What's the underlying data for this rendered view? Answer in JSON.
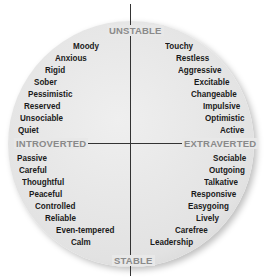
{
  "axes": {
    "top": "UNSTABLE",
    "bottom": "STABLE",
    "left": "INTROVERTED",
    "right": "EXTRAVERTED"
  },
  "quadrants": {
    "unstable_introverted": [
      "Moody",
      "Anxious",
      "Rigid",
      "Sober",
      "Pessimistic",
      "Reserved",
      "Unsociable",
      "Quiet"
    ],
    "unstable_extraverted": [
      "Touchy",
      "Restless",
      "Aggressive",
      "Excitable",
      "Changeable",
      "Impulsive",
      "Optimistic",
      "Active"
    ],
    "stable_introverted": [
      "Passive",
      "Careful",
      "Thoughtful",
      "Peaceful",
      "Controlled",
      "Reliable",
      "Even-tempered",
      "Calm"
    ],
    "stable_extraverted": [
      "Sociable",
      "Outgoing",
      "Talkative",
      "Responsive",
      "Easygoing",
      "Lively",
      "Carefree",
      "Leadership"
    ]
  },
  "colors": {
    "circle_fill": "#e4e4e4",
    "axis_label": "#8a8a8a",
    "trait_text": "#1a1a1a",
    "axis_line": "#333333"
  }
}
